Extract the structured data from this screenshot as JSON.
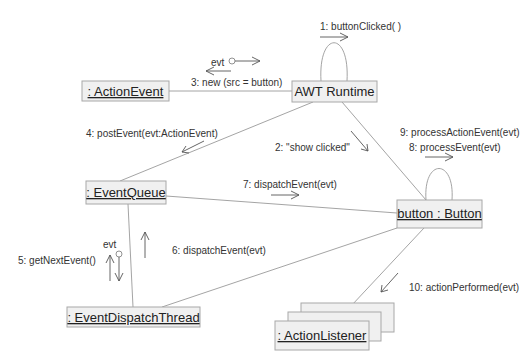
{
  "diagram": {
    "type": "UML collaboration diagram",
    "objects": {
      "action_event": ": ActionEvent",
      "awt_runtime": "AWT Runtime",
      "event_queue": ": EventQueue",
      "button": "button : Button",
      "event_dispatch_thread": ": EventDispatchThread",
      "action_listener": ": ActionListener"
    },
    "messages": {
      "m1": "1: buttonClicked( )",
      "m2": "2: \"show clicked\"",
      "m3": "3: new (src = button)",
      "m4": "4: postEvent(evt:ActionEvent)",
      "m5": "5: getNextEvent()",
      "m6": "6: dispatchEvent(evt)",
      "m7": "7: dispatchEvent(evt)",
      "m8": "8: processEvent(evt)",
      "m9": "9: processActionEvent(evt)",
      "m10": "10: actionPerformed(evt)"
    },
    "return_labels": {
      "evt_top": "evt",
      "evt_left": "evt"
    }
  }
}
